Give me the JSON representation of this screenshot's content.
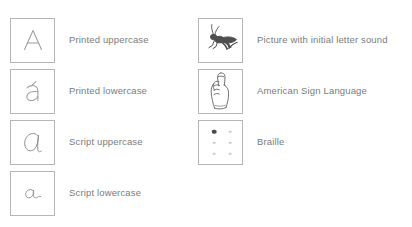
{
  "page": {
    "background_color": "#ffffff",
    "box_border_color": "#b6b6b6",
    "label_text_color": "#7b7b7b",
    "glyph_stroke_color": "#9a9a9a",
    "art_stroke_color": "#555555",
    "braille_filled_dot_color": "#4a4a4a",
    "braille_empty_dot_color": "#c9c9c9"
  },
  "columns": {
    "left": {
      "name": "letter-form-column",
      "rows": [
        {
          "glyph": "A",
          "glyph_icon": "printed-uppercase-a-glyph",
          "label": "Printed uppercase"
        },
        {
          "glyph": "a",
          "glyph_icon": "printed-lowercase-a-glyph",
          "label": "Printed lowercase"
        },
        {
          "glyph": "a",
          "glyph_icon": "script-uppercase-a-glyph",
          "label": "Script uppercase"
        },
        {
          "glyph": "a",
          "glyph_icon": "script-lowercase-a-glyph",
          "label": "Script lowercase"
        }
      ]
    },
    "right": {
      "name": "alternative-representation-column",
      "rows": [
        {
          "glyph_icon": "grasshopper-insect-picture",
          "label": "Picture with initial letter sound"
        },
        {
          "glyph_icon": "asl-letter-a-hand-icon",
          "label": "American Sign Language"
        },
        {
          "glyph_icon": "braille-cell-letter-a-icon",
          "label": "Braille"
        }
      ]
    }
  },
  "braille": {
    "rows": 3,
    "columns": 2,
    "dots": [
      {
        "position": 1,
        "filled": true
      },
      {
        "position": 4,
        "filled": false
      },
      {
        "position": 2,
        "filled": false
      },
      {
        "position": 5,
        "filled": false
      },
      {
        "position": 3,
        "filled": false
      },
      {
        "position": 6,
        "filled": false
      }
    ]
  }
}
